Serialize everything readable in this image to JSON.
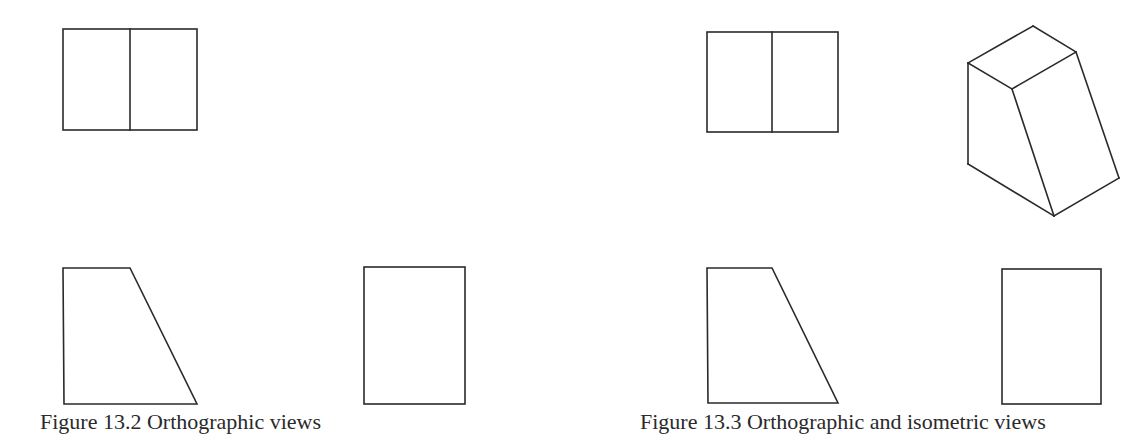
{
  "figure": {
    "type": "orthographic-projection",
    "stroke_color": "#2a2a2a",
    "background": "#ffffff"
  },
  "left_set": {
    "top_view": {
      "rect": {
        "x": 63,
        "y": 29,
        "w": 134,
        "h": 101
      },
      "divider_x": 130
    },
    "front_view": {
      "points": [
        [
          63,
          268
        ],
        [
          130,
          268
        ],
        [
          197,
          404
        ],
        [
          64,
          404
        ]
      ]
    },
    "side_view": {
      "rect": {
        "x": 364,
        "y": 267,
        "w": 101,
        "h": 137
      }
    }
  },
  "right_set": {
    "top_view": {
      "rect": {
        "x": 707,
        "y": 32,
        "w": 131,
        "h": 100
      },
      "divider_x": 772
    },
    "isometric_view": {
      "vertices": {
        "top_back": [
          1033,
          26
        ],
        "top_right": [
          1076,
          52
        ],
        "top_left": [
          968,
          63
        ],
        "top_front": [
          1012,
          89
        ],
        "bottom_left": [
          968,
          164
        ],
        "bottom_front": [
          1054,
          216
        ],
        "bottom_right": [
          1119,
          178
        ]
      }
    },
    "front_view": {
      "points": [
        [
          707,
          268
        ],
        [
          772,
          268
        ],
        [
          838,
          403
        ],
        [
          708,
          403
        ]
      ]
    },
    "side_view": {
      "rect": {
        "x": 1002,
        "y": 269,
        "w": 99,
        "h": 135
      }
    }
  },
  "captions": {
    "left": "Figure 13.2  Orthographic views",
    "right": "Figure 13.3  Orthographic and isometric views"
  }
}
